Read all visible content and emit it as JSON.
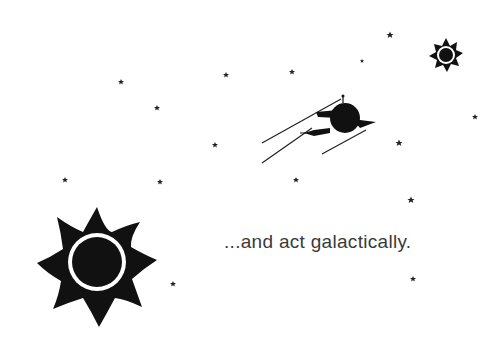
{
  "illustration": {
    "caption": "...and act galactically.",
    "colors": {
      "background": "#ffffff",
      "ink": "#111111",
      "text": "#3a3a3a"
    },
    "elements": {
      "large_sun": "sun-eclipse-icon",
      "small_sun": "sun-eclipse-icon",
      "ship": "planet-rocket-icon",
      "stars": "star-icon"
    },
    "star_count": 15
  }
}
